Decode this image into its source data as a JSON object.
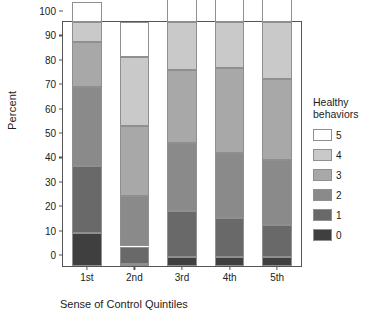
{
  "chart_data": {
    "type": "bar",
    "subtype": "stacked-percent",
    "title": "",
    "xlabel": "Sense of Control Quintiles",
    "ylabel": "Percent",
    "categories": [
      "1st",
      "2nd",
      "3rd",
      "4th",
      "5th"
    ],
    "ylim": [
      0,
      100
    ],
    "yticks": [
      0,
      10,
      20,
      30,
      40,
      50,
      60,
      70,
      80,
      90,
      100
    ],
    "grid": false,
    "legend_position": "right",
    "legend_title": "Healthy behaviors",
    "stack_order_bottom_to_top": [
      "0",
      "1",
      "2",
      "3",
      "4",
      "5"
    ],
    "series": [
      {
        "name": "0",
        "color": "#3f3f3f",
        "values": [
          13.5,
          0.8,
          3.5,
          3.5,
          3.5
        ]
      },
      {
        "name": "1",
        "color": "#696969",
        "values": [
          27.5,
          7.2,
          19.0,
          16.0,
          13.5
        ]
      },
      {
        "name": "2",
        "color": "#8a8a8a",
        "values": [
          32.5,
          20.5,
          28.0,
          27.0,
          26.5
        ]
      },
      {
        "name": "3",
        "color": "#a8a8a8",
        "values": [
          18.5,
          29.0,
          30.0,
          34.5,
          33.0
        ]
      },
      {
        "name": "4",
        "color": "#c9c9c9",
        "values": [
          8.0,
          28.0,
          19.5,
          19.0,
          23.5
        ]
      },
      {
        "name": "5",
        "color": "#ffffff",
        "values": [
          8.0,
          14.5,
          19.5,
          19.0,
          23.5
        ]
      }
    ],
    "cumulative_tops": [
      [
        13.5,
        41.0,
        73.5,
        92.0,
        100.0
      ],
      [
        0.8,
        8.0,
        28.5,
        57.5,
        85.5
      ],
      [
        3.5,
        22.5,
        50.5,
        80.5,
        100.0
      ],
      [
        3.5,
        19.5,
        46.5,
        81.0,
        100.0
      ],
      [
        3.5,
        17.0,
        43.5,
        76.5,
        100.0
      ]
    ]
  },
  "axes": {
    "y_title": "Percent",
    "x_title": "Sense of Control Quintiles",
    "y_ticks": [
      "100",
      "90",
      "80",
      "70",
      "60",
      "50",
      "40",
      "30",
      "20",
      "10",
      "0"
    ],
    "x_ticks": [
      "1st",
      "2nd",
      "3rd",
      "4th",
      "5th"
    ]
  },
  "legend": {
    "title_line1": "Healthy",
    "title_line2": "behaviors",
    "items": [
      {
        "label": "5",
        "color": "#ffffff"
      },
      {
        "label": "4",
        "color": "#c9c9c9"
      },
      {
        "label": "3",
        "color": "#a8a8a8"
      },
      {
        "label": "2",
        "color": "#8a8a8a"
      },
      {
        "label": "1",
        "color": "#696969"
      },
      {
        "label": "0",
        "color": "#3f3f3f"
      }
    ]
  },
  "colors": {
    "axis": "#555555",
    "segment_border": "#8f8f8f",
    "text": "#1c1c1c",
    "background": "#ffffff"
  }
}
